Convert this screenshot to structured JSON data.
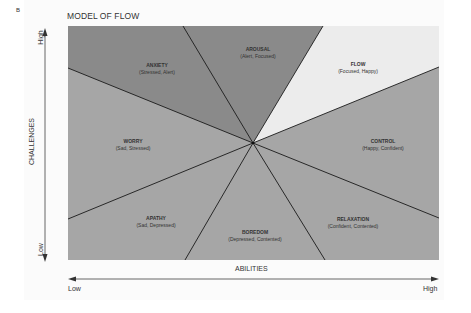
{
  "figure_label": "B",
  "title": "MODEL OF FLOW",
  "axes": {
    "y_label": "CHALLENGES",
    "y_high": "High",
    "y_low": "Low",
    "x_label": "ABILITIES",
    "x_low": "Low",
    "x_high": "High"
  },
  "regions": [
    {
      "name": "AROUSAL",
      "desc": "(Alert, Focused)",
      "color": "#8a8a8a"
    },
    {
      "name": "FLOW",
      "desc": "(Focused, Happy)",
      "color": "#ececec"
    },
    {
      "name": "CONTROL",
      "desc": "(Happy, Confident)",
      "color": "#a6a6a6"
    },
    {
      "name": "RELAXATION",
      "desc": "(Confident, Contented)",
      "color": "#a6a6a6"
    },
    {
      "name": "BOREDOM",
      "desc": "(Depressed, Contented)",
      "color": "#a6a6a6"
    },
    {
      "name": "APATHY",
      "desc": "(Sad, Depressed)",
      "color": "#a6a6a6"
    },
    {
      "name": "WORRY",
      "desc": "(Sad, Stressed)",
      "color": "#a6a6a6"
    },
    {
      "name": "ANXIETY",
      "desc": "(Stressed, Alert)",
      "color": "#8a8a8a"
    }
  ],
  "colors": {
    "line": "#1a1a1a",
    "axis": "#555555"
  }
}
